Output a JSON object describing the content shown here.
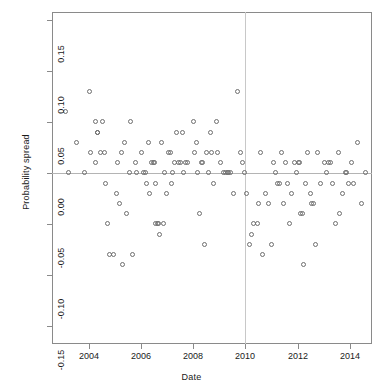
{
  "chart_data": {
    "type": "scatter",
    "title": "",
    "xlabel": "Date",
    "ylabel": "Probability spread",
    "grid": false,
    "legend": null,
    "xlim": [
      2002.6,
      2014.85
    ],
    "ylim": [
      -0.168,
      0.158
    ],
    "x_ticks": [
      2004,
      2006,
      2008,
      2010,
      2012,
      2014
    ],
    "x_tick_labels": [
      "2004",
      "2006",
      "2008",
      "2010",
      "2012",
      "2014"
    ],
    "y_ticks": [
      0.15,
      0.1,
      0.05,
      0.0,
      -0.05,
      -0.1,
      -0.15
    ],
    "y_tick_labels": [
      "0.15",
      "0.10",
      "0.05",
      "0.00",
      "-0.05",
      "-0.10",
      "-0.15"
    ],
    "annotations": [
      {
        "kind": "hline",
        "y": 0.0,
        "color": "#b4b4b4"
      },
      {
        "kind": "vline",
        "x": 2010.0,
        "color": "#c8c8c8"
      }
    ],
    "marker": {
      "shape": "open-circle",
      "size": 5,
      "color": "#6e6e6e"
    },
    "points": [
      [
        2003.1,
        0.06
      ],
      [
        2003.25,
        0.0
      ],
      [
        2003.55,
        0.03
      ],
      [
        2003.85,
        0.0
      ],
      [
        2004.05,
        0.08
      ],
      [
        2004.08,
        0.02
      ],
      [
        2004.25,
        0.01
      ],
      [
        2004.28,
        0.05
      ],
      [
        2004.35,
        0.04
      ],
      [
        2004.36,
        0.04
      ],
      [
        2004.45,
        0.02
      ],
      [
        2004.55,
        0.05
      ],
      [
        2004.6,
        0.02
      ],
      [
        2004.65,
        -0.01
      ],
      [
        2004.72,
        -0.05
      ],
      [
        2004.8,
        -0.08
      ],
      [
        2004.95,
        -0.08
      ],
      [
        2005.05,
        -0.02
      ],
      [
        2005.1,
        0.01
      ],
      [
        2005.18,
        -0.03
      ],
      [
        2005.25,
        0.02
      ],
      [
        2005.3,
        -0.09
      ],
      [
        2005.38,
        0.03
      ],
      [
        2005.45,
        -0.04
      ],
      [
        2005.55,
        0.0
      ],
      [
        2005.62,
        0.05
      ],
      [
        2005.7,
        -0.08
      ],
      [
        2005.78,
        0.01
      ],
      [
        2005.85,
        0.0
      ],
      [
        2006.02,
        0.02
      ],
      [
        2006.12,
        0.0
      ],
      [
        2006.18,
        0.0
      ],
      [
        2006.22,
        -0.01
      ],
      [
        2006.3,
        0.03
      ],
      [
        2006.35,
        -0.02
      ],
      [
        2006.42,
        0.01
      ],
      [
        2006.48,
        0.01
      ],
      [
        2006.52,
        0.01
      ],
      [
        2006.55,
        -0.01
      ],
      [
        2006.58,
        -0.05
      ],
      [
        2006.62,
        -0.05
      ],
      [
        2006.68,
        -0.05
      ],
      [
        2006.72,
        -0.06
      ],
      [
        2006.8,
        0.03
      ],
      [
        2006.85,
        -0.05
      ],
      [
        2006.92,
        0.0
      ],
      [
        2007.0,
        -0.02
      ],
      [
        2007.05,
        0.02
      ],
      [
        2007.12,
        0.02
      ],
      [
        2007.18,
        -0.01
      ],
      [
        2007.22,
        0.0
      ],
      [
        2007.3,
        0.01
      ],
      [
        2007.38,
        0.04
      ],
      [
        2007.45,
        0.01
      ],
      [
        2007.52,
        0.01
      ],
      [
        2007.58,
        0.04
      ],
      [
        2007.65,
        0.0
      ],
      [
        2007.72,
        0.01
      ],
      [
        2007.8,
        0.01
      ],
      [
        2008.0,
        0.05
      ],
      [
        2008.05,
        0.02
      ],
      [
        2008.12,
        0.03
      ],
      [
        2008.18,
        0.0
      ],
      [
        2008.25,
        -0.04
      ],
      [
        2008.32,
        0.01
      ],
      [
        2008.38,
        0.01
      ],
      [
        2008.45,
        -0.07
      ],
      [
        2008.52,
        0.02
      ],
      [
        2008.6,
        0.0
      ],
      [
        2008.65,
        0.04
      ],
      [
        2008.72,
        0.02
      ],
      [
        2008.8,
        -0.01
      ],
      [
        2008.88,
        0.05
      ],
      [
        2008.95,
        0.02
      ],
      [
        2009.05,
        0.01
      ],
      [
        2009.15,
        0.0
      ],
      [
        2009.25,
        0.0
      ],
      [
        2009.32,
        0.0
      ],
      [
        2009.35,
        0.0
      ],
      [
        2009.45,
        0.0
      ],
      [
        2009.55,
        -0.02
      ],
      [
        2009.7,
        0.08
      ],
      [
        2009.82,
        0.02
      ],
      [
        2009.88,
        0.01
      ],
      [
        2009.95,
        0.0
      ],
      [
        2010.05,
        -0.02
      ],
      [
        2010.15,
        -0.07
      ],
      [
        2010.22,
        -0.06
      ],
      [
        2010.32,
        -0.05
      ],
      [
        2010.45,
        -0.05
      ],
      [
        2010.52,
        -0.03
      ],
      [
        2010.58,
        0.02
      ],
      [
        2010.65,
        -0.08
      ],
      [
        2010.78,
        -0.02
      ],
      [
        2010.88,
        -0.03
      ],
      [
        2011.0,
        -0.07
      ],
      [
        2011.08,
        0.01
      ],
      [
        2011.15,
        0.0
      ],
      [
        2011.22,
        -0.01
      ],
      [
        2011.3,
        -0.01
      ],
      [
        2011.38,
        0.02
      ],
      [
        2011.45,
        -0.03
      ],
      [
        2011.52,
        0.01
      ],
      [
        2011.6,
        -0.01
      ],
      [
        2011.68,
        -0.05
      ],
      [
        2011.78,
        -0.02
      ],
      [
        2011.88,
        0.01
      ],
      [
        2011.95,
        0.0
      ],
      [
        2012.02,
        0.01
      ],
      [
        2012.08,
        0.01
      ],
      [
        2012.12,
        -0.04
      ],
      [
        2012.18,
        -0.04
      ],
      [
        2012.22,
        -0.09
      ],
      [
        2012.3,
        -0.01
      ],
      [
        2012.38,
        0.02
      ],
      [
        2012.48,
        -0.02
      ],
      [
        2012.55,
        -0.03
      ],
      [
        2012.62,
        -0.03
      ],
      [
        2012.7,
        -0.07
      ],
      [
        2012.78,
        0.02
      ],
      [
        2012.88,
        -0.01
      ],
      [
        2013.02,
        0.01
      ],
      [
        2013.12,
        0.0
      ],
      [
        2013.2,
        0.01
      ],
      [
        2013.28,
        0.01
      ],
      [
        2013.35,
        -0.01
      ],
      [
        2013.45,
        -0.05
      ],
      [
        2013.55,
        0.02
      ],
      [
        2013.62,
        -0.04
      ],
      [
        2013.72,
        -0.02
      ],
      [
        2013.82,
        0.0
      ],
      [
        2013.88,
        0.0
      ],
      [
        2013.95,
        -0.01
      ],
      [
        2014.05,
        0.01
      ],
      [
        2014.15,
        -0.01
      ],
      [
        2014.3,
        0.03
      ],
      [
        2014.45,
        -0.03
      ],
      [
        2014.62,
        0.0
      ]
    ]
  }
}
